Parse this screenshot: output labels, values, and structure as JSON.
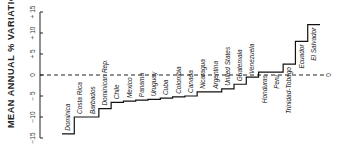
{
  "chart_data": {
    "type": "line",
    "subtype": "step",
    "title": "",
    "ylabel": "MEAN ANNUAL % VARIATION",
    "xlabel": "",
    "ylim": [
      -15,
      15
    ],
    "yticks": [
      -15,
      -10,
      -5,
      0,
      5,
      10,
      15
    ],
    "ytick_labels": [
      "−15",
      "−10",
      "− 5",
      "0",
      "+ 5",
      "+ 10",
      "+ 15"
    ],
    "zero_line": {
      "style": "dashed",
      "label": "0"
    },
    "grid": false,
    "categories": [
      "Dominica",
      "Costa Rica",
      "Barbados",
      "Dominican Rep.",
      "Chile",
      "Mexico",
      "Panama",
      "Uruguay",
      "Cuba",
      "Colombia",
      "Canada",
      "Nicaragua",
      "Argentina",
      "United States",
      "Guatemala",
      "Venezuela",
      "Honduras",
      "Peru",
      "Trinidad-Tobago",
      "Ecuador",
      "El Salvador"
    ],
    "values": [
      -14,
      -10,
      -10,
      -8,
      -6.5,
      -6.2,
      -6,
      -5.8,
      -5.5,
      -5.2,
      -5,
      -4,
      -4,
      -3.3,
      -2.2,
      -0.5,
      0.7,
      0.7,
      2.6,
      8,
      12
    ]
  }
}
